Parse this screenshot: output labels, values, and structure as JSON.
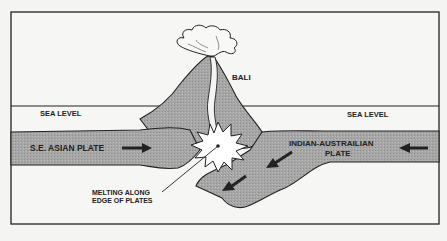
{
  "diagram": {
    "labels": {
      "volcano": "BALI",
      "sea_level_left": "SEA LEVEL",
      "sea_level_right": "SEA LEVEL",
      "left_plate": "S.E. ASIAN PLATE",
      "right_plate_line1": "INDIAN-AUSTRAILIAN",
      "right_plate_line2": "PLATE",
      "melting_line1": "MELTING ALONG",
      "melting_line2": "EDGE OF PLATES"
    },
    "icons": {
      "left_plate_arrow": "arrow-right-icon",
      "right_plate_arrow": "arrow-left-icon",
      "subduction_arrows": "arrow-down-left-icon",
      "eruption": "eruption-cloud-icon",
      "melting_zone": "starburst-icon"
    },
    "colors": {
      "background": "#f4f4f2",
      "plate_fill": "#a9a9a9",
      "outline": "#222222",
      "melt_fill": "#ffffff"
    }
  }
}
